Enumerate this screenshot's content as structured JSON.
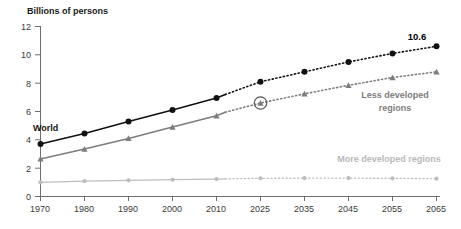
{
  "chart_data": {
    "type": "line",
    "title": "",
    "ylabel": "Billions of persons",
    "xlabel": "",
    "ylim": [
      0,
      12
    ],
    "yticks": [
      0,
      2,
      4,
      6,
      8,
      10,
      12
    ],
    "ytick_labels": [
      "0",
      "2",
      "4",
      "6",
      "8",
      "10",
      "12"
    ],
    "x": [
      1970,
      1980,
      1990,
      2000,
      2010,
      2025,
      2035,
      2045,
      2055,
      2065
    ],
    "xtick_labels": [
      "1970",
      "1980",
      "1990",
      "2000",
      "2010",
      "2025",
      "2035",
      "2045",
      "2055",
      "2065"
    ],
    "grid": false,
    "legend": "inline-annotations",
    "projection_starts_at": 2013,
    "series": [
      {
        "name": "World",
        "label": "World",
        "color": "#111111",
        "marker": "circle",
        "points": [
          {
            "year": 1970,
            "value": 3.7
          },
          {
            "year": 1980,
            "value": 4.45
          },
          {
            "year": 1990,
            "value": 5.3
          },
          {
            "year": 2000,
            "value": 6.1
          },
          {
            "year": 2010,
            "value": 6.95
          },
          {
            "year": 2013,
            "value": 7.2
          },
          {
            "year": 2025,
            "value": 8.1
          },
          {
            "year": 2035,
            "value": 8.8
          },
          {
            "year": 2045,
            "value": 9.5
          },
          {
            "year": 2055,
            "value": 10.1
          },
          {
            "year": 2065,
            "value": 10.6
          }
        ],
        "end_value_label": "10.6"
      },
      {
        "name": "Less developed regions",
        "label": "Less developed regions",
        "color": "#7d7d7d",
        "marker": "triangle",
        "highlighted_point_year": 2025,
        "points": [
          {
            "year": 1970,
            "value": 2.65
          },
          {
            "year": 1980,
            "value": 3.35
          },
          {
            "year": 1990,
            "value": 4.1
          },
          {
            "year": 2000,
            "value": 4.9
          },
          {
            "year": 2010,
            "value": 5.7
          },
          {
            "year": 2013,
            "value": 5.95
          },
          {
            "year": 2025,
            "value": 6.6
          },
          {
            "year": 2035,
            "value": 7.25
          },
          {
            "year": 2045,
            "value": 7.85
          },
          {
            "year": 2055,
            "value": 8.4
          },
          {
            "year": 2065,
            "value": 8.8
          }
        ]
      },
      {
        "name": "More developed regions",
        "label": "More developed regions",
        "color": "#bdbdbd",
        "marker": "circle",
        "points": [
          {
            "year": 1970,
            "value": 1.0
          },
          {
            "year": 1980,
            "value": 1.08
          },
          {
            "year": 1990,
            "value": 1.14
          },
          {
            "year": 2000,
            "value": 1.19
          },
          {
            "year": 2010,
            "value": 1.23
          },
          {
            "year": 2013,
            "value": 1.25
          },
          {
            "year": 2025,
            "value": 1.28
          },
          {
            "year": 2035,
            "value": 1.3
          },
          {
            "year": 2045,
            "value": 1.3
          },
          {
            "year": 2055,
            "value": 1.28
          },
          {
            "year": 2065,
            "value": 1.26
          }
        ]
      }
    ],
    "annotations": [
      {
        "name": "world-label",
        "text": "World"
      },
      {
        "name": "less-developed-label-line1",
        "text": "Less developed"
      },
      {
        "name": "less-developed-label-line2",
        "text": "regions"
      },
      {
        "name": "more-developed-label",
        "text": "More developed regions"
      },
      {
        "name": "world-end-value",
        "text": "10.6"
      }
    ]
  }
}
